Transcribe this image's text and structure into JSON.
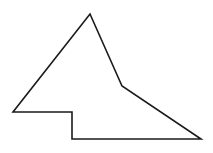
{
  "diagram": {
    "background": "#ffffff",
    "shape": {
      "type": "polygon",
      "stroke": "#1a1a1a",
      "stroke_width": 1.6,
      "fill": "none",
      "points": [
        [
          90,
          14
        ],
        [
          122,
          86
        ],
        [
          201,
          139
        ],
        [
          72,
          139
        ],
        [
          72,
          112
        ],
        [
          13,
          112
        ]
      ]
    }
  }
}
